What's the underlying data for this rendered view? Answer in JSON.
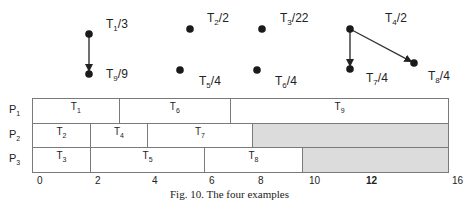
{
  "dag": {
    "nodes": [
      {
        "id": "T1",
        "name": "T",
        "sub": "1",
        "weight": "3",
        "x": 89,
        "y": 34,
        "lx": 106,
        "ly": 17
      },
      {
        "id": "T2",
        "name": "T",
        "sub": "2",
        "weight": "2",
        "x": 190,
        "y": 29,
        "lx": 207,
        "ly": 11
      },
      {
        "id": "T3",
        "name": "T",
        "sub": "3",
        "weight": "22",
        "x": 262,
        "y": 29,
        "lx": 280,
        "ly": 11
      },
      {
        "id": "T4",
        "name": "T",
        "sub": "4",
        "weight": "2",
        "x": 350,
        "y": 29,
        "lx": 385,
        "ly": 11
      },
      {
        "id": "T5",
        "name": "T",
        "sub": "5",
        "weight": "4",
        "x": 180,
        "y": 70,
        "lx": 199,
        "ly": 74
      },
      {
        "id": "T6",
        "name": "T",
        "sub": "6",
        "weight": "4",
        "x": 257,
        "y": 70,
        "lx": 275,
        "ly": 74
      },
      {
        "id": "T7",
        "name": "T",
        "sub": "7",
        "weight": "4",
        "x": 350,
        "y": 69,
        "lx": 366,
        "ly": 71
      },
      {
        "id": "T8",
        "name": "T",
        "sub": "8",
        "weight": "4",
        "x": 414,
        "y": 63,
        "lx": 428,
        "ly": 69
      },
      {
        "id": "T9",
        "name": "T",
        "sub": "9",
        "weight": "9",
        "x": 89,
        "y": 74,
        "lx": 106,
        "ly": 67
      }
    ],
    "edges": [
      {
        "from": "T1",
        "to": "T9"
      },
      {
        "from": "T4",
        "to": "T7"
      },
      {
        "from": "T4",
        "to": "T8"
      }
    ]
  },
  "gantt": {
    "time_unit_px": 26,
    "origin_x": 32,
    "processors": [
      {
        "label": "P",
        "sub": "1",
        "tasks": [
          {
            "name": "T",
            "sub": "1",
            "start": 0,
            "end": 3.33
          },
          {
            "name": "T",
            "sub": "6",
            "start": 3.33,
            "end": 7.62
          },
          {
            "name": "T",
            "sub": "9",
            "start": 7.62,
            "end": 16
          }
        ]
      },
      {
        "label": "P",
        "sub": "2",
        "tasks": [
          {
            "name": "T",
            "sub": "2",
            "start": 0,
            "end": 2.23
          },
          {
            "name": "T",
            "sub": "4",
            "start": 2.23,
            "end": 4.42
          },
          {
            "name": "T",
            "sub": "7",
            "start": 4.42,
            "end": 8.46
          },
          {
            "name": "",
            "sub": "",
            "start": 8.46,
            "end": 16,
            "idle": true
          }
        ]
      },
      {
        "label": "P",
        "sub": "3",
        "tasks": [
          {
            "name": "T",
            "sub": "3",
            "start": 0,
            "end": 2.23
          },
          {
            "name": "T",
            "sub": "5",
            "start": 2.23,
            "end": 6.62
          },
          {
            "name": "T",
            "sub": "8",
            "start": 6.62,
            "end": 10.38
          },
          {
            "name": "",
            "sub": "",
            "start": 10.38,
            "end": 16,
            "idle": true
          }
        ]
      }
    ],
    "ticks": [
      {
        "label": "0",
        "x": 37
      },
      {
        "label": "2",
        "x": 95
      },
      {
        "label": "4",
        "x": 152
      },
      {
        "label": "6",
        "x": 209
      },
      {
        "label": "8",
        "x": 258
      },
      {
        "label": "10",
        "x": 309
      },
      {
        "label": "12",
        "x": 366,
        "bold": true
      },
      {
        "label": "16",
        "x": 452
      }
    ]
  },
  "caption": "Fig. 10.  The four  examples"
}
